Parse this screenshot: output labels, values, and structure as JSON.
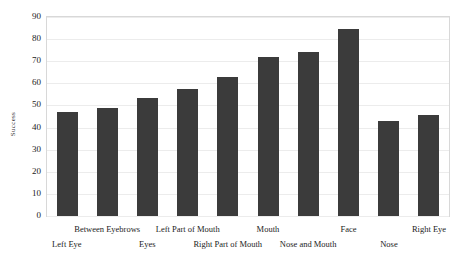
{
  "chart_data": {
    "type": "bar",
    "title": "",
    "xlabel": "",
    "ylabel": "Success",
    "ylim": [
      0,
      90
    ],
    "yticks": [
      0,
      10,
      20,
      30,
      40,
      50,
      60,
      70,
      80,
      90
    ],
    "grid": true,
    "legend": "none",
    "bar_color": "#3b3b3b",
    "gridline_color": "#ececec",
    "frame_color": "#d8d8d8",
    "categories": [
      "Left Eye",
      "Between Eyebrows",
      "Eyes",
      "Left Part of Mouth",
      "Right Part of Mouth",
      "Mouth",
      "Nose and Mouth",
      "Face",
      "Nose",
      "Right Eye"
    ],
    "values": [
      47,
      49,
      53.5,
      57.5,
      63,
      72,
      74,
      84.5,
      43,
      45.5
    ],
    "label_rows": [
      1,
      0,
      1,
      0,
      1,
      0,
      1,
      0,
      1,
      0
    ]
  },
  "axis": {
    "y_label": "Success",
    "y_tick_labels": [
      "90",
      "80",
      "70",
      "60",
      "50",
      "40",
      "30",
      "20",
      "10",
      "0"
    ]
  }
}
